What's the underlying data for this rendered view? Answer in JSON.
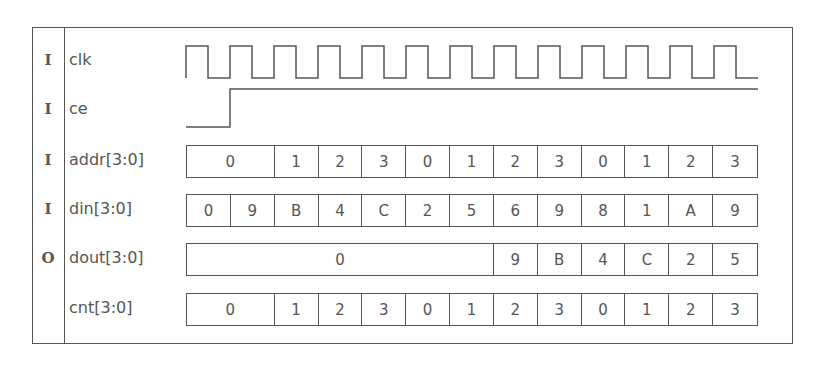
{
  "diagram": {
    "type": "timing-diagram",
    "start_x": 186,
    "period_px": 44,
    "signals": [
      {
        "dir": "I",
        "name": "clk",
        "kind": "clock",
        "cycles": 13
      },
      {
        "dir": "I",
        "name": "ce",
        "kind": "bit",
        "transitions": [
          {
            "at_cycle": 0,
            "level": 0
          },
          {
            "at_cycle": 1,
            "level": 1
          }
        ]
      },
      {
        "dir": "I",
        "name": "addr[3:0]",
        "kind": "bus",
        "segments": [
          {
            "value": "0",
            "span": 2
          },
          {
            "value": "1",
            "span": 1
          },
          {
            "value": "2",
            "span": 1
          },
          {
            "value": "3",
            "span": 1
          },
          {
            "value": "0",
            "span": 1
          },
          {
            "value": "1",
            "span": 1
          },
          {
            "value": "2",
            "span": 1
          },
          {
            "value": "3",
            "span": 1
          },
          {
            "value": "0",
            "span": 1
          },
          {
            "value": "1",
            "span": 1
          },
          {
            "value": "2",
            "span": 1
          },
          {
            "value": "3",
            "span": 1
          }
        ]
      },
      {
        "dir": "I",
        "name": "din[3:0]",
        "kind": "bus",
        "segments": [
          {
            "value": "0",
            "span": 1
          },
          {
            "value": "9",
            "span": 1
          },
          {
            "value": "B",
            "span": 1
          },
          {
            "value": "4",
            "span": 1
          },
          {
            "value": "C",
            "span": 1
          },
          {
            "value": "2",
            "span": 1
          },
          {
            "value": "5",
            "span": 1
          },
          {
            "value": "6",
            "span": 1
          },
          {
            "value": "9",
            "span": 1
          },
          {
            "value": "8",
            "span": 1
          },
          {
            "value": "1",
            "span": 1
          },
          {
            "value": "A",
            "span": 1
          },
          {
            "value": "9",
            "span": 1
          }
        ]
      },
      {
        "dir": "O",
        "name": "dout[3:0]",
        "kind": "bus",
        "segments": [
          {
            "value": "0",
            "span": 7
          },
          {
            "value": "9",
            "span": 1
          },
          {
            "value": "B",
            "span": 1
          },
          {
            "value": "4",
            "span": 1
          },
          {
            "value": "C",
            "span": 1
          },
          {
            "value": "2",
            "span": 1
          },
          {
            "value": "5",
            "span": 1
          }
        ]
      },
      {
        "dir": "",
        "name": "cnt[3:0]",
        "kind": "bus",
        "segments": [
          {
            "value": "0",
            "span": 2
          },
          {
            "value": "1",
            "span": 1
          },
          {
            "value": "2",
            "span": 1
          },
          {
            "value": "3",
            "span": 1
          },
          {
            "value": "0",
            "span": 1
          },
          {
            "value": "1",
            "span": 1
          },
          {
            "value": "2",
            "span": 1
          },
          {
            "value": "3",
            "span": 1
          },
          {
            "value": "0",
            "span": 1
          },
          {
            "value": "1",
            "span": 1
          },
          {
            "value": "2",
            "span": 1
          },
          {
            "value": "3",
            "span": 1
          }
        ]
      }
    ]
  }
}
